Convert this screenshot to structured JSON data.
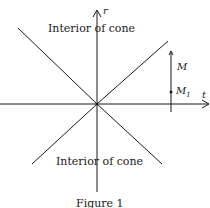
{
  "figure": {
    "caption": "Figure 1",
    "axes": {
      "vertical": "r",
      "horizontal": "t"
    },
    "regions": {
      "upper": "Interior of cone",
      "lower": "Interior of cone"
    },
    "points": {
      "upper": "M",
      "lower": "M",
      "lower_subscript": "1"
    },
    "line_color": "#1a1a1a"
  }
}
